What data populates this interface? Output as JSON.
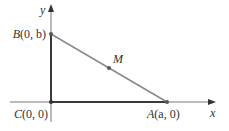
{
  "diagram": {
    "type": "right-triangle-coordinate",
    "axes": {
      "x_label": "x",
      "y_label": "y"
    },
    "points": {
      "B": {
        "label": "B(0, b)",
        "letter": "B",
        "coords": "(0, b)"
      },
      "C": {
        "label": "C(0, 0)",
        "letter": "C",
        "coords": "(0, 0)"
      },
      "A": {
        "label": "A(a, 0)",
        "letter": "A",
        "coords": "(a, 0)"
      },
      "M": {
        "label": "M",
        "letter": "M"
      }
    },
    "colors": {
      "axis": "#555555",
      "legs": "#3a3a3a",
      "hypotenuse": "#8a8a8a",
      "point": "#555555",
      "text": "#333333"
    }
  }
}
